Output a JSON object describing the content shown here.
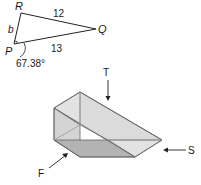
{
  "triangle": {
    "vertices": {
      "R": "R",
      "Q": "Q",
      "P": "P"
    },
    "sides": {
      "RQ": "12",
      "RP": "b",
      "PQ": "13"
    },
    "angle_P": "67.38°"
  },
  "prism": {
    "arrows": {
      "top": "T",
      "front": "F",
      "side": "S"
    }
  },
  "colors": {
    "stroke": "#555555",
    "face_light": "#dcdcdc",
    "face_mid": "#c8c8c8",
    "face_dark": "#a9a9a9"
  }
}
